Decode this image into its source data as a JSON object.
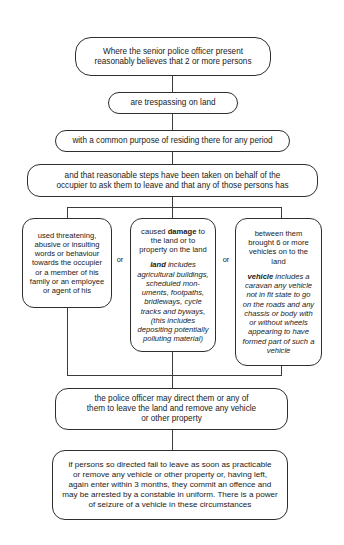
{
  "diagram": {
    "connector_label_or": "or",
    "nodes": {
      "senior_officer": {
        "line1": "Where the senior police officer present",
        "line2": "reasonably believes that 2 or more persons"
      },
      "trespassing": {
        "text": "are trespassing on land"
      },
      "common_purpose": {
        "text": "with a common purpose of residing there for any period"
      },
      "reasonable_steps": {
        "line1": "and that reasonable steps have been taken on behalf of the",
        "line2": "occupier to ask them to leave and that any of those persons has"
      },
      "branch_threatening": {
        "text": "used threatening, abusive or insulting words or behaviour towards the occupier or a member of his family or an employee or agent of his"
      },
      "branch_damage": {
        "lead_before": "caused ",
        "lead_bold": "damage",
        "lead_after": " to the land or to property on the land",
        "defn_term": "land",
        "defn_text": " includes agricultural buildings, scheduled mon-uments, footpaths, bridleways, cycle tracks and byways, (this includes depositing potentially polluting material)"
      },
      "branch_vehicles": {
        "lead": "between them brought 6 or more vehicles on to the land",
        "defn_term": "vehicle",
        "defn_text": " includes a caravan any vehicle not in fit state to go on the roads and any chassis or body with or without wheels appearing to have formed part of such a vehicle"
      },
      "direction": {
        "line1": "the police officer may direct them or any of",
        "line2": "them to leave the land and remove any vehicle",
        "line3": "or other property"
      },
      "offence": {
        "line1": "if persons so directed fail to leave as soon as practicable",
        "line2": "or remove any vehicle or other property or, having left,",
        "line3": "again enter within 3 months, they commit an offence and",
        "line4": "may be arrested by a constable in uniform. There is a power",
        "line5": "of seizure of a vehicle in these circumstances"
      }
    }
  },
  "colors": {
    "background": "#ffffff",
    "ink": "#1a1a1a",
    "stroke": "#2e2e2e",
    "connector": "#3b3b3b"
  }
}
